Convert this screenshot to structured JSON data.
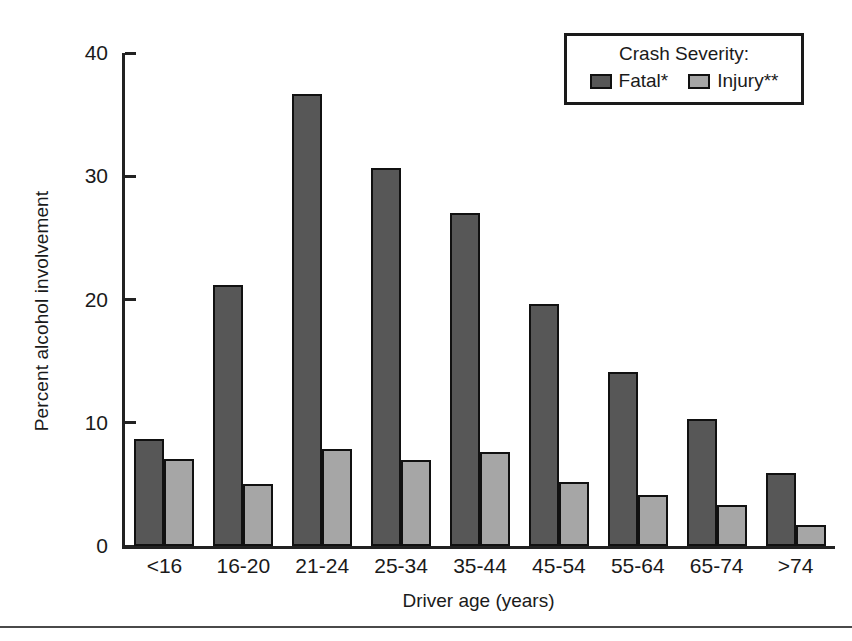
{
  "chart_data": {
    "type": "bar",
    "title": "",
    "xlabel": "Driver age (years)",
    "ylabel": "Percent alcohol involvement",
    "ylim": [
      0,
      40
    ],
    "yticks": [
      0,
      10,
      20,
      30,
      40
    ],
    "grid": false,
    "legend_position": "top-right",
    "legend_title": "Crash Severity:",
    "categories": [
      "<16",
      "16-20",
      "21-24",
      "25-34",
      "35-44",
      "45-54",
      "55-64",
      "65-74",
      ">74"
    ],
    "series": [
      {
        "name": "Fatal*",
        "color": "#575757",
        "values": [
          8.7,
          21.2,
          36.7,
          30.7,
          27.0,
          19.6,
          14.1,
          10.3,
          5.9
        ]
      },
      {
        "name": "Injury**",
        "color": "#a6a6a6",
        "values": [
          7.1,
          5.0,
          7.9,
          7.0,
          7.6,
          5.2,
          4.1,
          3.3,
          1.7
        ]
      }
    ]
  }
}
